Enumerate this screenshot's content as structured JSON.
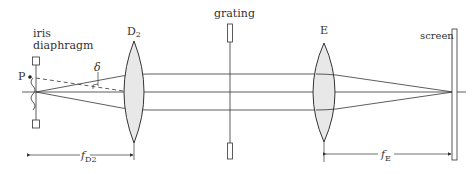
{
  "diagram": {
    "labels": {
      "iris_line1": "iris",
      "iris_line2": "diaphragm",
      "point": "P",
      "angle": "δ",
      "lens1": "D",
      "lens1_sub": "2",
      "grating": "grating",
      "lens2": "E",
      "screen": "screen",
      "focal1_main": "f",
      "focal1_sub": "D2",
      "focal2_main": "f",
      "focal2_sub": "E"
    },
    "components": [
      {
        "name": "iris diaphragm",
        "x": 36
      },
      {
        "name": "lens D2",
        "x": 134
      },
      {
        "name": "grating",
        "x": 230
      },
      {
        "name": "lens E",
        "x": 324
      },
      {
        "name": "screen",
        "x": 455
      }
    ],
    "colors": {
      "line": "#333333",
      "lens_fill": "#e8e8e8",
      "background": "#ffffff"
    }
  }
}
